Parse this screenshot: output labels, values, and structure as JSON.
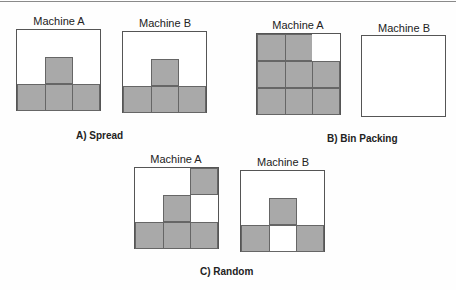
{
  "colors": {
    "filled": "#a9a9a9",
    "empty": "#ffffff",
    "border": "#555555"
  },
  "panels": [
    {
      "caption": "A) Spread",
      "machines": [
        {
          "label": "Machine A",
          "filled_cells": [
            [
              2,
              0
            ],
            [
              2,
              1
            ],
            [
              2,
              2
            ],
            [
              1,
              1
            ]
          ]
        },
        {
          "label": "Machine B",
          "filled_cells": [
            [
              2,
              0
            ],
            [
              2,
              1
            ],
            [
              2,
              2
            ],
            [
              1,
              1
            ]
          ]
        }
      ]
    },
    {
      "caption": "B) Bin Packing",
      "machines": [
        {
          "label": "Machine A",
          "filled_cells": [
            [
              0,
              0
            ],
            [
              0,
              1
            ],
            [
              1,
              0
            ],
            [
              1,
              1
            ],
            [
              1,
              2
            ],
            [
              2,
              0
            ],
            [
              2,
              1
            ],
            [
              2,
              2
            ]
          ]
        },
        {
          "label": "Machine B",
          "filled_cells": []
        }
      ]
    },
    {
      "caption": "C) Random",
      "machines": [
        {
          "label": "Machine A",
          "filled_cells": [
            [
              0,
              2
            ],
            [
              1,
              1
            ],
            [
              2,
              0
            ],
            [
              2,
              1
            ],
            [
              2,
              2
            ]
          ]
        },
        {
          "label": "Machine B",
          "filled_cells": [
            [
              1,
              1
            ],
            [
              2,
              0
            ],
            [
              2,
              2
            ]
          ]
        }
      ]
    }
  ]
}
